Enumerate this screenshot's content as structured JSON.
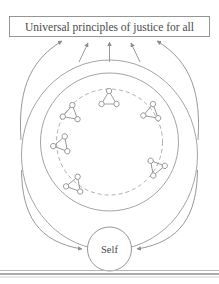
{
  "figure": {
    "banner": {
      "text": "Universal principles of justice for all"
    },
    "center": {
      "label": "Self"
    },
    "rings": {
      "outer_label": "outer-ellipse",
      "middle_label": "middle-circle",
      "inner_label": "inner-dashed-circle"
    },
    "upward_arrows_count": "5",
    "inward_arrows_count": "2",
    "clusters": [
      {
        "id": "cluster-top",
        "cx": 109,
        "cy": 99,
        "rot": 0
      },
      {
        "id": "cluster-upper-right",
        "cx": 152,
        "cy": 113,
        "rot": 130
      },
      {
        "id": "cluster-lower-right",
        "cx": 156,
        "cy": 168,
        "rot": 200
      },
      {
        "id": "cluster-bottom-left",
        "cx": 74,
        "cy": 185,
        "rot": 260
      },
      {
        "id": "cluster-left",
        "cx": 62,
        "cy": 144,
        "rot": 20
      },
      {
        "id": "cluster-upper-left",
        "cx": 71,
        "cy": 113,
        "rot": 10
      }
    ],
    "colors": {
      "stroke": "#9a9a9a",
      "text": "#4a4a4a",
      "background": "#ffffff"
    }
  }
}
